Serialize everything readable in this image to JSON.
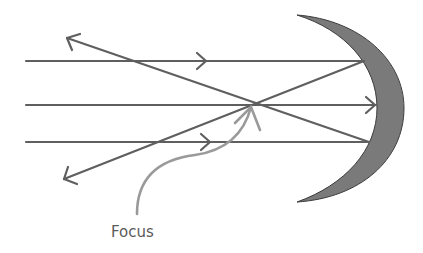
{
  "diagram": {
    "label": "Focus",
    "colors": {
      "ray": "#5f5f5f",
      "mirror_fill": "#7a7a7a",
      "mirror_stroke": "#3c3c3c",
      "pointer": "#9a9a9a",
      "label": "#5a5a5a"
    },
    "elements": [
      {
        "type": "incident-ray",
        "y": 61,
        "direction": "right"
      },
      {
        "type": "incident-ray",
        "y": 105,
        "direction": "right"
      },
      {
        "type": "incident-ray",
        "y": 142,
        "direction": "right"
      },
      {
        "type": "reflected-ray",
        "from": "top",
        "to": "bottom-left"
      },
      {
        "type": "reflected-ray",
        "from": "bottom",
        "to": "top-left"
      },
      {
        "type": "mirror",
        "shape": "crescent-concave"
      },
      {
        "type": "focus-pointer",
        "label": "Focus"
      }
    ]
  }
}
